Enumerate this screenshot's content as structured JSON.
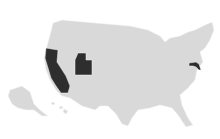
{
  "map": {
    "type": "choropleth",
    "region": "United States",
    "base_color": "#d9d9d9",
    "highlight_color": "#2e2e2e",
    "background": "#ffffff",
    "highlighted_states": [
      "California",
      "Utah",
      "Maryland"
    ]
  }
}
